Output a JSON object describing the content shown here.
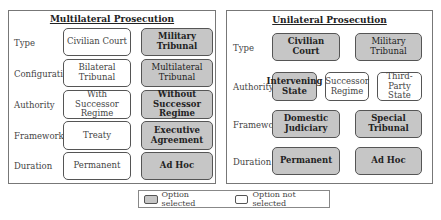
{
  "left": {
    "title": "Multilateral Prosecution",
    "rows": [
      {
        "label": "Type",
        "options": [
          {
            "text": "Civilian Court",
            "selected": false
          },
          {
            "text": "Military Tribunal",
            "selected": true
          }
        ]
      },
      {
        "label": "Configuration",
        "options": [
          {
            "text": "Bilateral Tribunal",
            "selected": false
          },
          {
            "text": "Multilateral Tribunal",
            "selected": true
          }
        ]
      },
      {
        "label": "Authority",
        "options": [
          {
            "text": "With Successor Regime",
            "selected": false
          },
          {
            "text": "Without Successor Regime",
            "selected": true
          }
        ]
      },
      {
        "label": "Framework",
        "options": [
          {
            "text": "Treaty",
            "selected": false
          },
          {
            "text": "Executive Agreement",
            "selected": true
          }
        ]
      },
      {
        "label": "Duration",
        "options": [
          {
            "text": "Permanent",
            "selected": false
          },
          {
            "text": "Ad Hoc",
            "selected": true
          }
        ]
      }
    ]
  },
  "right": {
    "title": "Unilateral Prosecution",
    "rows": [
      {
        "label": "Type",
        "options": [
          {
            "text": "Civilian Court",
            "selected": true
          },
          {
            "text": "Military Tribunal",
            "selected": true
          }
        ]
      },
      {
        "label": "Authority",
        "options": [
          {
            "text": "Intervening State",
            "selected": true
          },
          {
            "text": "Successor Regime",
            "selected": false
          },
          {
            "text": "Third-Party State",
            "selected": false
          }
        ]
      },
      {
        "label": "Framework",
        "options": [
          {
            "text": "Domestic Judiciary",
            "selected": true
          },
          {
            "text": "Special Tribunal",
            "selected": true
          }
        ]
      },
      {
        "label": "Duration",
        "options": [
          {
            "text": "Permanent",
            "selected": true
          },
          {
            "text": "Ad Hoc",
            "selected": true
          }
        ]
      }
    ]
  },
  "legend": {
    "selected": "Option selected",
    "not_selected": "Option not selected"
  },
  "colors": {
    "selected_fill": "#c6c6c6",
    "unselected_fill": "#ffffff",
    "border": "#555555"
  }
}
